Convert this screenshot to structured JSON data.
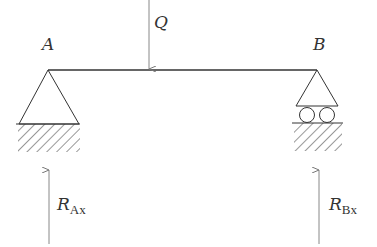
{
  "diagram": {
    "type": "simply-supported-beam",
    "beam": {
      "from": "A",
      "to": "B"
    },
    "supports": [
      {
        "id": "A",
        "label": "A",
        "kind": "pinned"
      },
      {
        "id": "B",
        "label": "B",
        "kind": "roller"
      }
    ],
    "loads": [
      {
        "id": "Q",
        "label": "Q",
        "direction": "down"
      }
    ],
    "reactions": [
      {
        "id": "RAx",
        "symbol": "R",
        "subscript": "Ax",
        "direction": "up"
      },
      {
        "id": "RBx",
        "symbol": "R",
        "subscript": "Bx",
        "direction": "up"
      }
    ],
    "colors": {
      "line": "#333333",
      "arrow": "#888888",
      "text": "#333333"
    }
  }
}
